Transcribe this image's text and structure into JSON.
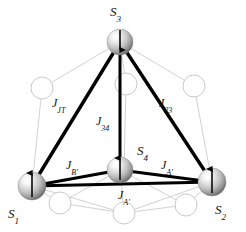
{
  "figure": {
    "background_color": "#ffffff",
    "bond_color": "#000000",
    "ligand_outline_color": "#c9c9c9",
    "sphere_light": "#ffffff",
    "sphere_mid": "#c0c0c0",
    "sphere_dark": "#6e6e6e",
    "label_color": "#111111"
  },
  "spins": [
    {
      "id": "S3",
      "base": "S",
      "sub": "3",
      "label": "S3",
      "arrow": "down",
      "cx": 120,
      "cy": 42,
      "r": 13,
      "label_x": 110,
      "label_y": 3
    },
    {
      "id": "S4",
      "base": "S",
      "sub": "4",
      "label": "S4",
      "arrow": "up",
      "cx": 120,
      "cy": 170,
      "r": 13,
      "label_x": 137,
      "label_y": 142
    },
    {
      "id": "S1",
      "base": "S",
      "sub": "1",
      "label": "S1",
      "arrow": "up",
      "cx": 32,
      "cy": 186,
      "r": 14,
      "label_x": 8,
      "label_y": 205
    },
    {
      "id": "S2",
      "base": "S",
      "sub": "2",
      "label": "S2",
      "arrow": "up",
      "cx": 212,
      "cy": 182,
      "r": 14,
      "label_x": 215,
      "label_y": 201
    }
  ],
  "couplings": [
    {
      "id": "J_JT",
      "base": "J",
      "sub": "JT",
      "label": "J_JT",
      "from": "S3",
      "to": "S1",
      "label_x": 52,
      "label_y": 94
    },
    {
      "id": "J_23",
      "base": "J",
      "sub": "23",
      "label": "J_23",
      "from": "S3",
      "to": "S2",
      "label_x": 159,
      "label_y": 94
    },
    {
      "id": "J_34",
      "base": "J",
      "sub": "34",
      "label": "J_34",
      "from": "S3",
      "to": "S4",
      "label_x": 96,
      "label_y": 112
    },
    {
      "id": "J_Bp",
      "base": "J",
      "sub": "B'",
      "label": "J_B'",
      "from": "S1",
      "to": "S4",
      "label_x": 66,
      "label_y": 156
    },
    {
      "id": "J_Ap_right",
      "base": "J",
      "sub": "A'",
      "label": "J_A'",
      "from": "S4",
      "to": "S2",
      "label_x": 161,
      "label_y": 156
    },
    {
      "id": "J_Ap_bottom",
      "base": "J",
      "sub": "A'",
      "label": "J_A'",
      "from": "S1",
      "to": "S2",
      "label_x": 118,
      "label_y": 186
    }
  ],
  "ligands": [
    {
      "id": "ligand-upper-left",
      "cx": 42,
      "cy": 88,
      "r": 11
    },
    {
      "id": "ligand-upper-right",
      "cx": 194,
      "cy": 86,
      "r": 11
    },
    {
      "id": "ligand-upper-center",
      "cx": 126,
      "cy": 84,
      "r": 11
    },
    {
      "id": "ligand-lower-left",
      "cx": 60,
      "cy": 203,
      "r": 11
    },
    {
      "id": "ligand-lower-center",
      "cx": 124,
      "cy": 213,
      "r": 11
    },
    {
      "id": "ligand-lower-right",
      "cx": 186,
      "cy": 205,
      "r": 11
    }
  ]
}
